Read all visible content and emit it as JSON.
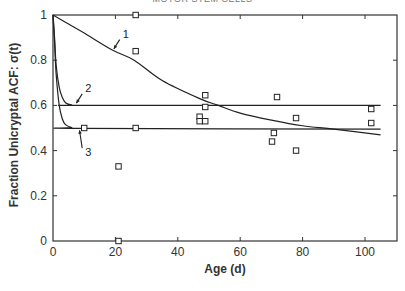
{
  "header": {
    "cropped_title": "MOTOR STEM CELLS"
  },
  "chart_data": {
    "type": "line",
    "title": "",
    "xlabel": "Age (d)",
    "ylabel": "Fraction Unicryptal ACF:  σ(t)",
    "xlim": [
      0,
      110
    ],
    "ylim": [
      0,
      1
    ],
    "x_ticks": [
      0,
      20,
      40,
      60,
      80,
      100
    ],
    "x_tick_labels": [
      "0",
      "20",
      "40",
      "60",
      "80",
      "100"
    ],
    "y_ticks": [
      0,
      0.2,
      0.4,
      0.6,
      0.8,
      1
    ],
    "y_tick_labels": [
      "0",
      "0.2",
      "0.4",
      "0.6",
      "0.8",
      "1"
    ],
    "grid": false,
    "legend": "none (curves labeled 1, 2, 3 with arrows)",
    "series": [
      {
        "name": "1",
        "kind": "line",
        "x": [
          0,
          5,
          10,
          19,
          26,
          35,
          47,
          53,
          60,
          70,
          80,
          90,
          105
        ],
        "y": [
          1.0,
          0.96,
          0.92,
          0.845,
          0.8,
          0.71,
          0.63,
          0.6,
          0.566,
          0.535,
          0.51,
          0.495,
          0.47
        ]
      },
      {
        "name": "2",
        "kind": "line",
        "x": [
          0,
          0.5,
          1,
          2,
          3,
          4,
          6,
          10,
          105
        ],
        "y": [
          1.0,
          0.9,
          0.78,
          0.68,
          0.635,
          0.612,
          0.602,
          0.6,
          0.6
        ]
      },
      {
        "name": "3",
        "kind": "line",
        "x": [
          0,
          0.5,
          1,
          2,
          3,
          4,
          6,
          8,
          105
        ],
        "y": [
          1.0,
          0.88,
          0.74,
          0.6,
          0.54,
          0.515,
          0.502,
          0.498,
          0.495
        ]
      },
      {
        "name": "observed",
        "kind": "scatter",
        "marker": "open-square",
        "x": [
          10,
          21,
          21,
          26.5,
          26.5,
          26.5,
          47,
          47,
          48.8,
          48.8,
          48.8,
          70.2,
          70.8,
          71.8,
          77.9,
          77.9,
          102,
          102
        ],
        "y": [
          0.5,
          0.33,
          0.0,
          1.0,
          0.84,
          0.5,
          0.55,
          0.53,
          0.645,
          0.593,
          0.53,
          0.44,
          0.478,
          0.637,
          0.544,
          0.4,
          0.584,
          0.522
        ]
      }
    ],
    "annotations": [
      {
        "text": "1",
        "x": 22,
        "y": 0.9,
        "arrow_to": [
          19.5,
          0.85
        ]
      },
      {
        "text": "2",
        "x": 10,
        "y": 0.66,
        "arrow_to": [
          7.5,
          0.61
        ]
      },
      {
        "text": "3",
        "x": 10,
        "y": 0.42,
        "arrow_to": [
          8.5,
          0.49
        ]
      }
    ]
  }
}
